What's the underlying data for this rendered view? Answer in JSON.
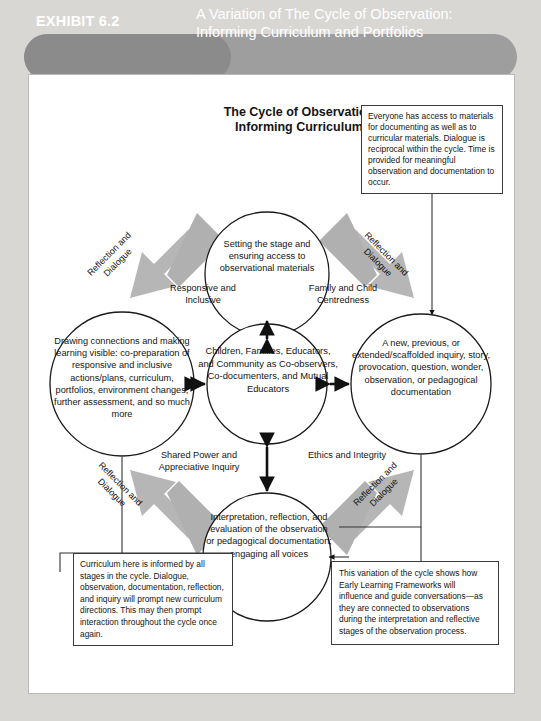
{
  "banner": {
    "exhibit_label": "EXHIBIT 6.2",
    "title_line1": "A Variation of The Cycle of Observation:",
    "title_line2": "Informing Curriculum and Portfolios",
    "color_left": "#8b8b8b",
    "color_right": "#9e9e9e",
    "text_color": "#ffffff"
  },
  "diagram": {
    "title_line1": "The Cycle of Observation",
    "title_line2": "Informing Curriculum",
    "circles": {
      "top": "Setting the stage and ensuring access to observational materials",
      "center": "Children, Families, Educators, and Community as Co-observers, Co-documenters, and Mutual Educators",
      "left": "Drawing connections and making learning visible: co-preparation of responsive and inclusive actions/plans, curriculum, portfolios, environment changes, further assessment, and so much more",
      "right": "A new, previous, or extended/scaffolded inquiry, story, provocation, question, wonder, observation, or pedagogical documentation",
      "bottom": "Interpretation, reflection, and evaluation of the observation or pedagogical documentation; engaging all voices"
    },
    "quadrant_labels": {
      "top_left": "Responsive and Inclusive",
      "top_right": "Family and Child Centredness",
      "bottom_left": "Shared Power and Appreciative Inquiry",
      "bottom_right": "Ethics and Integrity"
    },
    "diagonal_labels": {
      "top_left_line1": "Reflection and",
      "top_left_line2": "Dialogue",
      "top_right_line1": "Reflection and",
      "top_right_line2": "Dialogue",
      "bottom_left_line1": "Reflection and",
      "bottom_left_line2": "Dialogue",
      "bottom_right_line1": "Reflection and",
      "bottom_right_line2": "Dialogue"
    },
    "colors": {
      "arrow_gray": "#b3b3b3",
      "arrow_gray_dark": "#a0a0a0",
      "circle_stroke": "#1a1a1a",
      "circle_fill": "#ffffff",
      "page_background": "#d9d7d3",
      "card_background": "#ffffff"
    }
  },
  "notes": {
    "top_right": "Everyone has access to materials for documenting as well as to curricular materials. Dialogue is reciprocal within the cycle. Time is provided for meaningful observation and documentation to occur.",
    "bottom_left": "Curriculum here is informed by all stages in the cycle. Dialogue, observation, documentation, reflection, and inquiry will prompt new curriculum directions. This may then prompt interaction throughout the cycle once again.",
    "bottom_right": "This variation of the cycle shows how Early Learning Frameworks will influence and guide conversations—as they are connected to observations during the interpretation and reflective stages of the observation process."
  }
}
